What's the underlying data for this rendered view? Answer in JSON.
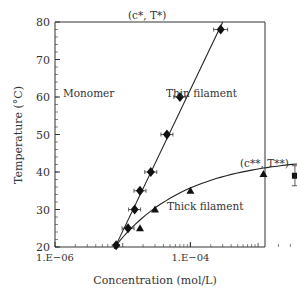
{
  "chart_data": {
    "type": "scatter",
    "title": "",
    "xlabel": "Concentration (mol/L)",
    "ylabel": "Temperature (°C)",
    "xscale": "log",
    "xlim": [
      1e-06,
      1
    ],
    "ylim": [
      20,
      80
    ],
    "x_ticks": [
      "1.E−06",
      "1.E−04",
      "1.E−02",
      "1.E−00"
    ],
    "y_ticks": [
      20,
      30,
      40,
      50,
      60,
      70,
      80
    ],
    "grid": false,
    "legend": null,
    "annotations": [
      {
        "text": "(c*, T*)",
        "x": 0.0003,
        "y": 80
      },
      {
        "text": "(c**, T**)",
        "x": 0.3,
        "y": 43.5
      },
      {
        "text": "Monomer",
        "x": 1e-05,
        "y": 60
      },
      {
        "text": "Thin filament",
        "x": 0.005,
        "y": 60
      },
      {
        "text": "Thick filament",
        "x": 0.005,
        "y": 30
      }
    ],
    "series": [
      {
        "name": "Monomer–thin boundary (diamonds)",
        "marker": "diamond",
        "points": [
          [
            8e-06,
            20.5
          ],
          [
            1.2e-05,
            25
          ],
          [
            1.5e-05,
            30
          ],
          [
            1.8e-05,
            35
          ],
          [
            2.6e-05,
            40
          ],
          [
            4.5e-05,
            50
          ],
          [
            7e-05,
            60
          ],
          [
            0.00028,
            78
          ]
        ]
      },
      {
        "name": "Monomer–thick boundary (triangles)",
        "marker": "triangle",
        "points": [
          [
            1.8e-05,
            25
          ],
          [
            3e-05,
            30
          ],
          [
            0.0001,
            35
          ],
          [
            0.0012,
            39.5
          ]
        ]
      },
      {
        "name": "Thin–thick boundary (squares/circles)",
        "marker": "square",
        "points": [
          [
            0.0035,
            39
          ],
          [
            0.009,
            41
          ],
          [
            0.02,
            43
          ],
          [
            0.03,
            43.5
          ]
        ]
      },
      {
        "name": "Thin filament (open circles)",
        "marker": "open-circle",
        "points": [
          [
            0.009,
            52
          ],
          [
            0.03,
            52
          ],
          [
            0.3,
            52
          ],
          [
            0.03,
            68
          ],
          [
            0.3,
            68
          ]
        ]
      },
      {
        "name": "Thick filament (open triangles)",
        "marker": "open-triangle",
        "points": [
          [
            0.009,
            22.5
          ],
          [
            0.03,
            22.5
          ],
          [
            0.3,
            22.5
          ],
          [
            0.03,
            36.5
          ],
          [
            0.3,
            36.5
          ]
        ]
      }
    ]
  },
  "labels": {
    "xlabel": "Concentration (mol/L)",
    "ylabel": "Temperature (°C)",
    "monomer": "Monomer",
    "thin": "Thin filament",
    "thick": "Thick filament"
  }
}
